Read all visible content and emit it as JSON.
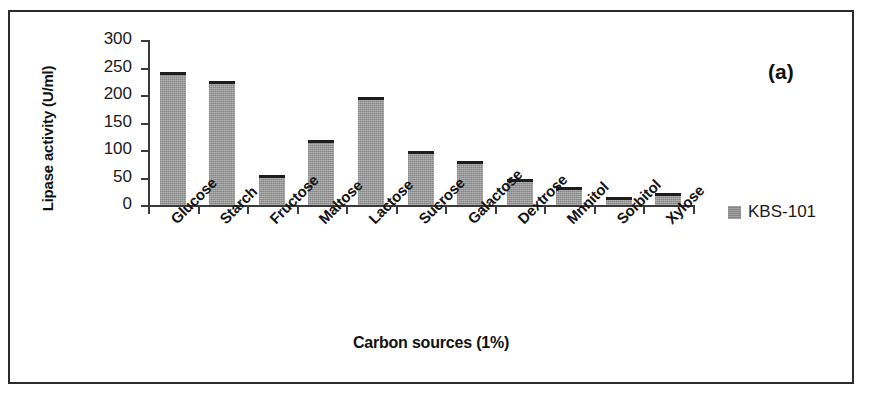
{
  "figure": {
    "panel_label": "(a)",
    "border_color": "#2b2b2b",
    "background": "#ffffff"
  },
  "legend": {
    "position": "right",
    "swatch_color": "#8e8e8e",
    "entries": [
      {
        "label": "KBS-101"
      }
    ]
  },
  "chart_data": {
    "type": "bar",
    "title": "",
    "subtitle": "",
    "xlabel": "Carbon sources (1%)",
    "ylabel": "Lipase activity (U/ml)",
    "ylim": [
      0,
      300
    ],
    "yticks": [
      0,
      50,
      100,
      150,
      200,
      250,
      300
    ],
    "ytick_labels": [
      "0",
      "50",
      "100",
      "150",
      "200",
      "250",
      "300"
    ],
    "grid": false,
    "legend_position": "right",
    "annotations": [
      "(a)"
    ],
    "bar_color": "#969696",
    "error_bar_color": "#1d1d1d",
    "categories": [
      "Glucose",
      "Starch",
      "Fructose",
      "Maltose",
      "Lactose",
      "Sucrose",
      "Galactose",
      "Dextrose",
      "Mnnitol",
      "Sorbitol",
      "Xylose"
    ],
    "series": [
      {
        "name": "KBS-101",
        "values": [
          242,
          225,
          55,
          118,
          197,
          98,
          80,
          48,
          32,
          15,
          21
        ]
      }
    ]
  }
}
